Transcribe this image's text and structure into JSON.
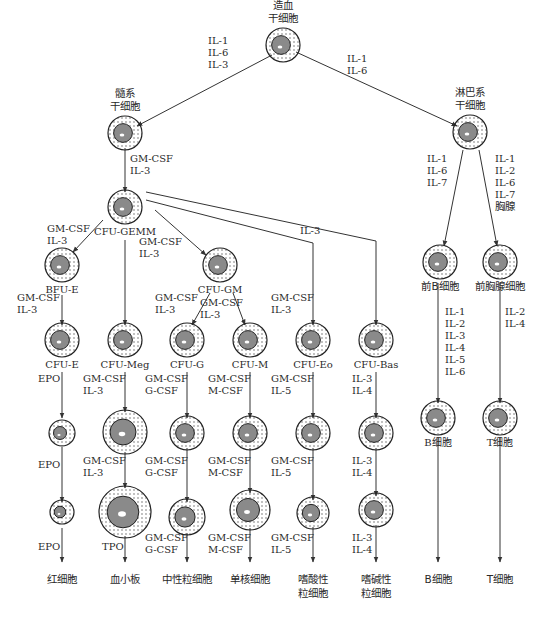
{
  "colors": {
    "line": "#333333",
    "nucleus": "#8a8a8a",
    "text": "#2a2a2a"
  },
  "nodes": [
    {
      "id": "hsc",
      "label": [
        "造血",
        "干细胞"
      ],
      "x": 283,
      "y": 45,
      "r": 13,
      "label_pos": "above"
    },
    {
      "id": "myeloid",
      "label": [
        "髓系",
        "干细胞"
      ],
      "x": 125,
      "y": 133,
      "r": 13,
      "label_pos": "above"
    },
    {
      "id": "lymphoid",
      "label": [
        "淋巴系",
        "干细胞"
      ],
      "x": 470,
      "y": 132,
      "r": 13,
      "label_pos": "above"
    },
    {
      "id": "cfu_gemm",
      "label": [
        "CFU-GEMM"
      ],
      "x": 125,
      "y": 207,
      "r": 13,
      "label_pos": "below"
    },
    {
      "id": "bfu_e",
      "label": [
        "BFU-E"
      ],
      "x": 62,
      "y": 265,
      "r": 13,
      "label_pos": "below"
    },
    {
      "id": "cfu_gm",
      "label": [
        "CFU-GM"
      ],
      "x": 220,
      "y": 265,
      "r": 13,
      "label_pos": "below"
    },
    {
      "id": "pre_b",
      "label": [
        "前B细胞"
      ],
      "x": 440,
      "y": 262,
      "r": 13,
      "label_pos": "below"
    },
    {
      "id": "pre_t",
      "label": [
        "前胸腺细胞"
      ],
      "x": 500,
      "y": 262,
      "r": 13,
      "label_pos": "below"
    },
    {
      "id": "cfu_e",
      "label": [
        "CFU-E"
      ],
      "x": 62,
      "y": 340,
      "r": 13,
      "label_pos": "below"
    },
    {
      "id": "cfu_meg",
      "label": [
        "CFU-Meg"
      ],
      "x": 125,
      "y": 340,
      "r": 13,
      "label_pos": "below"
    },
    {
      "id": "cfu_g",
      "label": [
        "CFU-G"
      ],
      "x": 187,
      "y": 340,
      "r": 13,
      "label_pos": "below"
    },
    {
      "id": "cfu_m",
      "label": [
        "CFU-M"
      ],
      "x": 250,
      "y": 340,
      "r": 13,
      "label_pos": "below"
    },
    {
      "id": "cfu_eo",
      "label": [
        "CFU-Eo"
      ],
      "x": 313,
      "y": 340,
      "r": 13,
      "label_pos": "below"
    },
    {
      "id": "cfu_bas",
      "label": [
        "CFU-Bas"
      ],
      "x": 376,
      "y": 340,
      "r": 13,
      "label_pos": "below"
    },
    {
      "id": "b_cell_mid",
      "label": [
        "B细胞"
      ],
      "x": 438,
      "y": 418,
      "r": 13,
      "label_pos": "below"
    },
    {
      "id": "t_cell_mid",
      "label": [
        "T细胞"
      ],
      "x": 500,
      "y": 418,
      "r": 13,
      "label_pos": "below"
    },
    {
      "id": "ery_mid",
      "label": [],
      "x": 62,
      "y": 433,
      "r": 9,
      "label_pos": "none"
    },
    {
      "id": "meg_mid",
      "label": [],
      "x": 125,
      "y": 432,
      "r": 18,
      "label_pos": "none"
    },
    {
      "id": "neu_mid",
      "label": [],
      "x": 187,
      "y": 433,
      "r": 13,
      "label_pos": "none"
    },
    {
      "id": "mono_mid",
      "label": [],
      "x": 250,
      "y": 433,
      "r": 13,
      "label_pos": "none"
    },
    {
      "id": "eo_mid",
      "label": [],
      "x": 313,
      "y": 433,
      "r": 13,
      "label_pos": "none"
    },
    {
      "id": "bas_mid",
      "label": [],
      "x": 376,
      "y": 433,
      "r": 13,
      "label_pos": "none"
    },
    {
      "id": "ery_late",
      "label": [],
      "x": 62,
      "y": 512,
      "r": 8,
      "label_pos": "none"
    },
    {
      "id": "platelet_late",
      "label": [],
      "x": 125,
      "y": 512,
      "r": 22,
      "label_pos": "none"
    },
    {
      "id": "neu_late",
      "label": [],
      "x": 187,
      "y": 517,
      "r": 14,
      "label_pos": "none"
    },
    {
      "id": "mono_late",
      "label": [],
      "x": 250,
      "y": 510,
      "r": 16,
      "label_pos": "none"
    },
    {
      "id": "eo_late",
      "label": [],
      "x": 313,
      "y": 513,
      "r": 12,
      "label_pos": "none"
    },
    {
      "id": "bas_late",
      "label": [],
      "x": 376,
      "y": 510,
      "r": 13,
      "label_pos": "none"
    }
  ],
  "final_cells": [
    {
      "label": [
        "红细胞"
      ],
      "x": 62
    },
    {
      "label": [
        "血小板"
      ],
      "x": 125
    },
    {
      "label": [
        "中性粒细胞"
      ],
      "x": 187
    },
    {
      "label": [
        "单核细胞"
      ],
      "x": 250
    },
    {
      "label": [
        "嗜酸性",
        "粒细胞"
      ],
      "x": 313
    },
    {
      "label": [
        "嗜碱性",
        "粒细胞"
      ],
      "x": 376
    },
    {
      "label": [
        "B细胞"
      ],
      "x": 438
    },
    {
      "label": [
        "T细胞"
      ],
      "x": 500
    }
  ],
  "edges": [
    {
      "from": [
        272,
        55
      ],
      "to": [
        137,
        126
      ],
      "factors": [
        "IL-1",
        "IL-6",
        "IL-3"
      ],
      "fx": 208,
      "fy": 44
    },
    {
      "from": [
        296,
        52
      ],
      "to": [
        457,
        126
      ],
      "factors": [
        "IL-1",
        "IL-6"
      ],
      "fx": 347,
      "fy": 62
    },
    {
      "from": [
        125,
        148
      ],
      "to": [
        125,
        192
      ],
      "factors": [
        "GM-CSF",
        "IL-3"
      ],
      "fx": 130,
      "fy": 162
    },
    {
      "from": [
        103,
        220
      ],
      "to": [
        73,
        252
      ],
      "factors": [
        "GM-CSF",
        "IL-3"
      ],
      "fx": 47,
      "fy": 232
    },
    {
      "from": [
        125,
        240
      ],
      "to": [
        125,
        325
      ],
      "factors": [],
      "fx": 0,
      "fy": 0
    },
    {
      "from": [
        155,
        210
      ],
      "to": [
        206,
        255
      ],
      "factors": [
        "GM-CSF",
        "IL-3"
      ],
      "fx": 139,
      "fy": 245
    },
    {
      "from": [
        62,
        295
      ],
      "to": [
        62,
        325
      ],
      "factors": [
        "GM-CSF",
        "IL-3"
      ],
      "fx": 17,
      "fy": 301
    },
    {
      "from": [
        210,
        293
      ],
      "to": [
        192,
        325
      ],
      "factors": [
        "GM-CSF",
        "IL-3"
      ],
      "fx": 155,
      "fy": 301
    },
    {
      "from": [
        233,
        293
      ],
      "to": [
        245,
        325
      ],
      "factors": [
        "GM-CSF",
        "IL-3"
      ],
      "fx": 200,
      "fy": 306
    },
    {
      "from": [
        62,
        372
      ],
      "to": [
        62,
        418
      ],
      "factors": [
        "EPO"
      ],
      "fx": 38,
      "fy": 382
    },
    {
      "from": [
        125,
        372
      ],
      "to": [
        125,
        412
      ],
      "factors": [
        "GM-CSF",
        "IL-3"
      ],
      "fx": 83,
      "fy": 382
    },
    {
      "from": [
        187,
        372
      ],
      "to": [
        187,
        418
      ],
      "factors": [
        "GM-CSF",
        "G-CSF"
      ],
      "fx": 145,
      "fy": 382
    },
    {
      "from": [
        250,
        372
      ],
      "to": [
        250,
        418
      ],
      "factors": [
        "GM-CSF",
        "M-CSF"
      ],
      "fx": 208,
      "fy": 382
    },
    {
      "from": [
        313,
        372
      ],
      "to": [
        313,
        418
      ],
      "factors": [
        "GM-CSF",
        "IL-5"
      ],
      "fx": 271,
      "fy": 382
    },
    {
      "from": [
        376,
        372
      ],
      "to": [
        376,
        418
      ],
      "factors": [
        "IL-3",
        "IL-4"
      ],
      "fx": 352,
      "fy": 382
    },
    {
      "from": [
        62,
        447
      ],
      "to": [
        62,
        502
      ],
      "factors": [
        "EPO"
      ],
      "fx": 38,
      "fy": 468
    },
    {
      "from": [
        125,
        452
      ],
      "to": [
        125,
        488
      ],
      "factors": [
        "GM-CSF",
        "IL-3"
      ],
      "fx": 83,
      "fy": 464
    },
    {
      "from": [
        187,
        448
      ],
      "to": [
        187,
        502
      ],
      "factors": [
        "GM-CSF",
        "G-CSF"
      ],
      "fx": 145,
      "fy": 464
    },
    {
      "from": [
        250,
        448
      ],
      "to": [
        250,
        493
      ],
      "factors": [
        "GM-CSF",
        "M-CSF"
      ],
      "fx": 208,
      "fy": 464
    },
    {
      "from": [
        313,
        448
      ],
      "to": [
        313,
        500
      ],
      "factors": [
        "GM-CSF",
        "IL-5"
      ],
      "fx": 271,
      "fy": 464
    },
    {
      "from": [
        376,
        448
      ],
      "to": [
        376,
        496
      ],
      "factors": [
        "IL-3",
        "IL-4"
      ],
      "fx": 352,
      "fy": 464
    },
    {
      "from": [
        62,
        528
      ],
      "to": [
        62,
        562
      ],
      "factors": [
        "EPO"
      ],
      "fx": 38,
      "fy": 550
    },
    {
      "from": [
        125,
        536
      ],
      "to": [
        125,
        562
      ],
      "factors": [
        "TPO"
      ],
      "fx": 102,
      "fy": 550
    },
    {
      "from": [
        187,
        533
      ],
      "to": [
        187,
        562
      ],
      "factors": [
        "GM-CSF",
        "G-CSF"
      ],
      "fx": 145,
      "fy": 541
    },
    {
      "from": [
        250,
        528
      ],
      "to": [
        250,
        562
      ],
      "factors": [
        "GM-CSF",
        "M-CSF"
      ],
      "fx": 208,
      "fy": 541
    },
    {
      "from": [
        313,
        527
      ],
      "to": [
        313,
        562
      ],
      "factors": [
        "GM-CSF",
        "IL-5"
      ],
      "fx": 271,
      "fy": 541
    },
    {
      "from": [
        376,
        525
      ],
      "to": [
        376,
        562
      ],
      "factors": [
        "IL-3",
        "IL-4"
      ],
      "fx": 352,
      "fy": 541
    },
    {
      "from": [
        463,
        150
      ],
      "to": [
        444,
        246
      ],
      "factors": [
        "IL-1",
        "IL-6",
        "IL-7"
      ],
      "fx": 427,
      "fy": 162
    },
    {
      "from": [
        479,
        150
      ],
      "to": [
        497,
        246
      ],
      "factors": [
        "IL-1",
        "IL-2",
        "IL-6",
        "IL-7",
        "胸腺"
      ],
      "fx": 495,
      "fy": 162
    },
    {
      "from": [
        438,
        283
      ],
      "to": [
        438,
        403
      ],
      "factors": [
        "IL-1",
        "IL-2",
        "IL-3",
        "IL-4",
        "IL-5",
        "IL-6"
      ],
      "fx": 445,
      "fy": 315
    },
    {
      "from": [
        500,
        283
      ],
      "to": [
        500,
        403
      ],
      "factors": [
        "IL-2",
        "IL-4"
      ],
      "fx": 505,
      "fy": 315
    },
    {
      "from": [
        438,
        437
      ],
      "to": [
        438,
        562
      ],
      "factors": [],
      "fx": 0,
      "fy": 0
    },
    {
      "from": [
        500,
        437
      ],
      "to": [
        500,
        562
      ],
      "factors": [],
      "fx": 0,
      "fy": 0
    }
  ],
  "bent_edges": [
    {
      "points": [
        [
          146,
          200
        ],
        [
          313,
          243
        ],
        [
          313,
          325
        ]
      ],
      "factors": [],
      "fx": 0,
      "fy": 0
    },
    {
      "points": [
        [
          146,
          192
        ],
        [
          376,
          241
        ],
        [
          376,
          325
        ]
      ],
      "factors": [
        "IL-3"
      ],
      "fx": 300,
      "fy": 234
    }
  ],
  "bent_labels": [
    {
      "factors": [
        "GM-CSF",
        "IL-3"
      ],
      "fx": 271,
      "fy": 301
    }
  ]
}
